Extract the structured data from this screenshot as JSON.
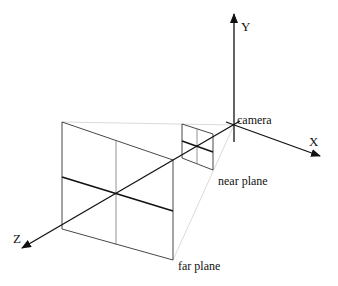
{
  "diagram": {
    "type": "camera view frustum",
    "axes": {
      "x_label": "X",
      "y_label": "Y",
      "z_label": "Z"
    },
    "labels": {
      "camera": "camera",
      "near_plane": "near plane",
      "far_plane": "far plane"
    },
    "colors": {
      "line": "#111111",
      "faint": "#cccccc",
      "background": "#ffffff"
    }
  }
}
